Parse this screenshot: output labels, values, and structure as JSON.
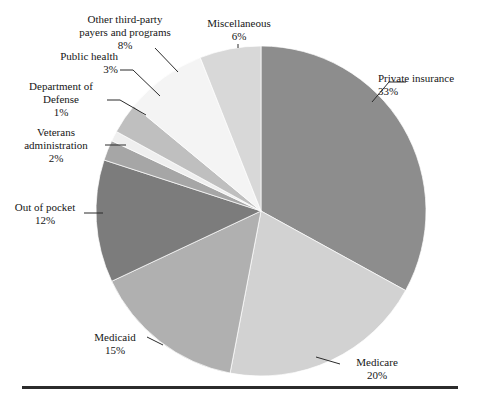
{
  "chart_data": {
    "type": "pie",
    "title": "",
    "subtitle": "",
    "xlabel": "",
    "ylabel": "",
    "legend_position": "none",
    "grid": false,
    "start_angle_deg": 0,
    "direction": "clockwise",
    "center": {
      "x": 261,
      "y": 211
    },
    "radius": 165,
    "categories": [
      "Private insurance",
      "Medicare",
      "Medicaid",
      "Out of pocket",
      "Veterans administration",
      "Department of Defense",
      "Public health",
      "Other third-party payers and programs",
      "Miscellaneous"
    ],
    "values": [
      33,
      20,
      15,
      12,
      2,
      1,
      3,
      8,
      6
    ],
    "value_labels": [
      "33%",
      "20%",
      "15%",
      "12%",
      "2%",
      "1%",
      "3%",
      "8%",
      "6%"
    ],
    "colors": [
      "#8d8d8d",
      "#d2d2d2",
      "#b0b0b0",
      "#7c7c7c",
      "#a6a6a6",
      "#efefef",
      "#bfbfbf",
      "#f4f4f4",
      "#d8d8d8"
    ],
    "slices": [
      {
        "name": "Private insurance",
        "value": 33,
        "value_label": "33%",
        "color": "#8d8d8d"
      },
      {
        "name": "Medicare",
        "value": 20,
        "value_label": "20%",
        "color": "#d2d2d2"
      },
      {
        "name": "Medicaid",
        "value": 15,
        "value_label": "15%",
        "color": "#b0b0b0"
      },
      {
        "name": "Out of pocket",
        "value": 12,
        "value_label": "12%",
        "color": "#7c7c7c"
      },
      {
        "name": "Veterans administration",
        "value": 2,
        "value_label": "2%",
        "color": "#a6a6a6"
      },
      {
        "name": "Department of Defense",
        "value": 1,
        "value_label": "1%",
        "color": "#efefef"
      },
      {
        "name": "Public health",
        "value": 3,
        "value_label": "3%",
        "color": "#bfbfbf"
      },
      {
        "name": "Other third-party payers and programs",
        "value": 8,
        "value_label": "8%",
        "color": "#f4f4f4"
      },
      {
        "name": "Miscellaneous",
        "value": 6,
        "value_label": "6%",
        "color": "#d8d8d8"
      }
    ]
  },
  "labels": {
    "private_insurance": {
      "line1": "Private insurance",
      "pct": "33%"
    },
    "medicare": {
      "line1": "Medicare",
      "pct": "20%"
    },
    "medicaid": {
      "line1": "Medicaid",
      "pct": "15%"
    },
    "out_of_pocket": {
      "line1": "Out of pocket",
      "pct": "12%"
    },
    "veterans_administration": {
      "line1": "Veterans",
      "line2": "administration",
      "pct": "2%"
    },
    "department_of_defense": {
      "line1": "Department of",
      "line2": "Defense",
      "pct": "1%"
    },
    "public_health": {
      "line1": "Public health",
      "pct": "3%"
    },
    "other_third_party": {
      "line1": "Other third-party",
      "line2": "payers and programs",
      "pct": "8%"
    },
    "miscellaneous": {
      "line1": "Miscellaneous",
      "pct": "6%"
    }
  },
  "style": {
    "rule_color": "#2b2b2b",
    "leader_color": "#2b2b2b",
    "background": "#ffffff",
    "text_color": "#161616"
  }
}
